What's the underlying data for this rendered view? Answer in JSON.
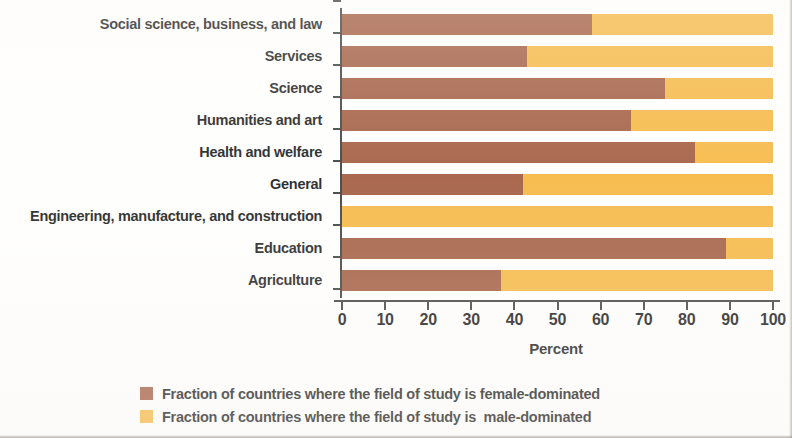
{
  "chart_data": {
    "type": "bar",
    "orientation": "horizontal",
    "stacked": true,
    "title": "",
    "xlabel": "Percent",
    "ylabel": "",
    "xlim": [
      0,
      100
    ],
    "xticks": [
      0,
      10,
      20,
      30,
      40,
      50,
      60,
      70,
      80,
      90,
      100
    ],
    "xtick_labels": [
      "0",
      "10",
      "20",
      "30",
      "40",
      "50",
      "60",
      "70",
      "80",
      "90",
      "100"
    ],
    "grid": false,
    "legend_position": "bottom",
    "categories": [
      "Social science, business, and law",
      "Services",
      "Science",
      "Humanities and art",
      "Health and welfare",
      "General",
      "Engineering, manufacture, and construction",
      "Education",
      "Agriculture"
    ],
    "series": [
      {
        "name": "Fraction of countries where the field of study is female-dominated",
        "color": "#a0583c",
        "values": [
          58,
          43,
          75,
          67,
          82,
          42,
          0,
          89,
          37
        ]
      },
      {
        "name": "Fraction of countries where the field of study is  male-dominated",
        "color": "#f6b63e",
        "values": [
          42,
          57,
          25,
          33,
          18,
          58,
          100,
          11,
          63
        ]
      }
    ]
  },
  "legend": {
    "items": [
      {
        "label": "Fraction of countries where the field of study is female-dominated",
        "swatch_name": "legend-swatch-female",
        "color": "#a0583c"
      },
      {
        "label": "Fraction of countries where the field of study is  male-dominated",
        "swatch_name": "legend-swatch-male",
        "color": "#f6b63e"
      }
    ]
  },
  "axis": {
    "x_title": "Percent"
  }
}
